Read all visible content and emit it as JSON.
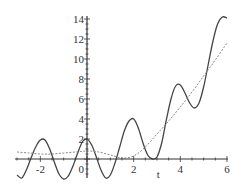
{
  "chart_data": {
    "type": "line",
    "title": "",
    "xlabel": "t",
    "ylabel": "",
    "xlim": [
      -3.0,
      6.0
    ],
    "ylim": [
      -2.1,
      14.5
    ],
    "grid": false,
    "legend": null,
    "x_ticks": [
      -2,
      0,
      2,
      4,
      6
    ],
    "x_tick_labels": [
      "-2",
      "0",
      "2",
      "4",
      "6"
    ],
    "y_ticks": [
      2,
      4,
      6,
      8,
      10,
      12,
      14
    ],
    "y_tick_labels": [
      "2",
      "4",
      "6",
      "8",
      "10",
      "12",
      "14"
    ],
    "series": [
      {
        "name": "solid-oscillating",
        "style": "solid",
        "color": "#444444",
        "x": [
          -3.0,
          -2.8,
          -2.6,
          -2.4,
          -2.2,
          -2.0,
          -1.8,
          -1.6,
          -1.4,
          -1.2,
          -1.0,
          -0.8,
          -0.6,
          -0.4,
          -0.2,
          0.0,
          0.2,
          0.4,
          0.6,
          0.8,
          1.0,
          1.2,
          1.4,
          1.6,
          1.8,
          2.0,
          2.2,
          2.4,
          2.6,
          2.8,
          3.0,
          3.2,
          3.4,
          3.6,
          3.8,
          4.0,
          4.2,
          4.4,
          4.6,
          4.8,
          5.0,
          5.2,
          5.4,
          5.6,
          5.8,
          6.0
        ],
        "values": [
          -1.6,
          -1.9,
          -1.1,
          0.1,
          1.2,
          1.9,
          1.9,
          1.0,
          -0.3,
          -1.5,
          -2.0,
          -1.7,
          -0.7,
          0.6,
          1.7,
          2.0,
          1.4,
          0.2,
          -1.1,
          -1.9,
          -1.6,
          -0.4,
          1.2,
          2.8,
          3.8,
          4.0,
          3.1,
          1.6,
          0.4,
          0.0,
          0.2,
          1.6,
          3.9,
          6.0,
          7.3,
          7.4,
          6.6,
          5.6,
          5.1,
          5.6,
          7.2,
          9.5,
          11.8,
          13.5,
          14.2,
          14.1
        ]
      },
      {
        "name": "dashed-growing",
        "style": "dashed",
        "color": "#888888",
        "x": [
          -3.0,
          -2.5,
          -2.0,
          -1.5,
          -1.0,
          -0.5,
          0.0,
          0.5,
          1.0,
          1.5,
          2.0,
          2.5,
          3.0,
          3.5,
          4.0,
          4.5,
          5.0,
          5.5,
          6.0
        ],
        "values": [
          0.7,
          0.6,
          0.5,
          0.5,
          0.6,
          0.7,
          0.8,
          0.7,
          0.4,
          0.1,
          0.3,
          1.2,
          2.5,
          3.8,
          5.2,
          6.7,
          8.3,
          9.9,
          11.6
        ]
      }
    ]
  }
}
